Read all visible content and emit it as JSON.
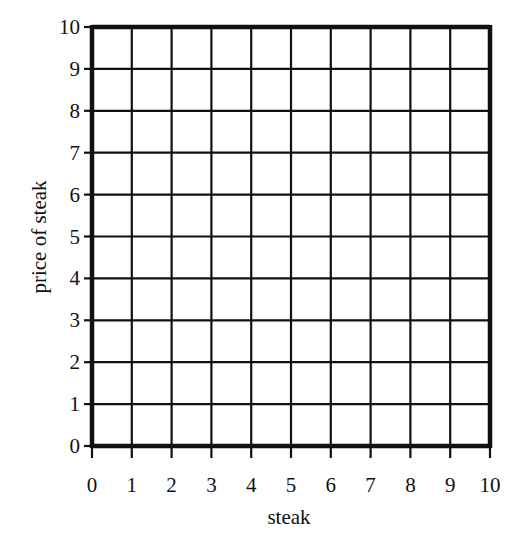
{
  "chart_data": {
    "type": "scatter",
    "title": "",
    "xlabel": "steak",
    "ylabel": "price of steak",
    "xlim": [
      0,
      10
    ],
    "ylim": [
      0,
      10
    ],
    "x_ticks": [
      "0",
      "1",
      "2",
      "3",
      "4",
      "5",
      "6",
      "7",
      "8",
      "9",
      "10"
    ],
    "y_ticks": [
      "0",
      "1",
      "2",
      "3",
      "4",
      "5",
      "6",
      "7",
      "8",
      "9",
      "10"
    ],
    "grid": true,
    "series": [],
    "legend": null
  },
  "colors": {
    "grid": "#111111",
    "background": "#ffffff"
  }
}
